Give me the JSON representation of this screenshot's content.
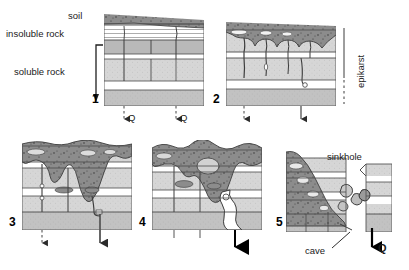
{
  "figure": {
    "type": "geological-cross-section-sequence",
    "panel_count": 5
  },
  "legend_labels": {
    "soil": "soil",
    "insoluble_rock": "insoluble rock",
    "soluble_rock": "soluble rock"
  },
  "annotations": {
    "epikarst": "epikarst",
    "sinkhole": "sinkhole",
    "cave": "cave"
  },
  "flow_labels": {
    "q1": "Q",
    "q2": "Q",
    "q5": "Q"
  },
  "panels": [
    {
      "number": "1",
      "caption": ""
    },
    {
      "number": "2",
      "caption": ""
    },
    {
      "number": "3",
      "caption": ""
    },
    {
      "number": "4",
      "caption": ""
    },
    {
      "number": "5",
      "caption": ""
    }
  ],
  "colors": {
    "soil": "#8c8c8c",
    "soil_dark": "#7a7a7a",
    "rock_light": "#d9d9d9",
    "rock_mid": "#cfcfcf",
    "rock_dark": "#b5b5b5",
    "white_band": "#ffffff",
    "line": "#3c3c3c",
    "text": "#1a1a1a",
    "background": "#ffffff"
  }
}
